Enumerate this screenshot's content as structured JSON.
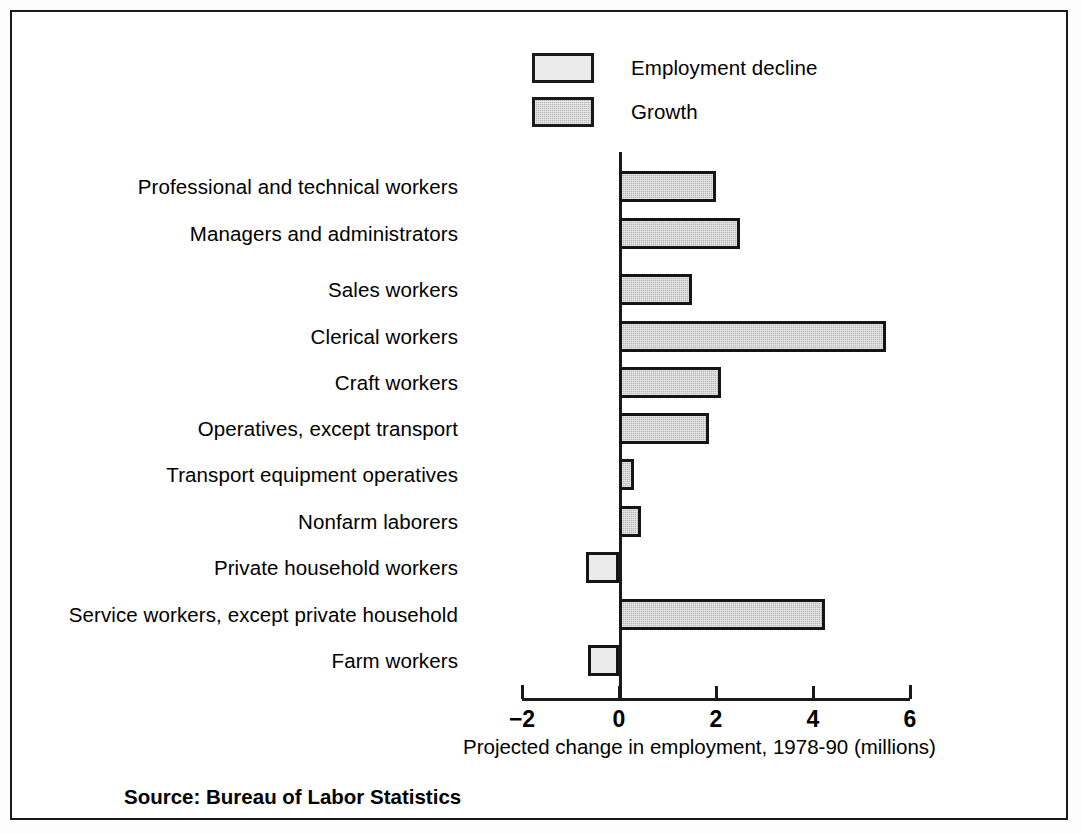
{
  "figure": {
    "background_color": "#ffffff",
    "frame_color": "#1a1a1a",
    "source_note": "Source: Bureau of Labor Statistics"
  },
  "legend": {
    "position": "top-center",
    "items": [
      {
        "label": "Employment decline",
        "swatch": "light-gray-square",
        "color": "#ebebeb"
      },
      {
        "label": "Growth",
        "swatch": "medium-gray-square",
        "color": "#b7b7b7"
      }
    ]
  },
  "chart_data": {
    "type": "bar",
    "orientation": "horizontal",
    "title": "",
    "subtitle": "",
    "xlabel": "Projected change in employment, 1978-90 (millions)",
    "ylabel": "",
    "xlim": [
      -2,
      6
    ],
    "xticks": [
      -2,
      0,
      2,
      4,
      6
    ],
    "xticklabels": [
      "−2",
      "0",
      "2",
      "4",
      "6"
    ],
    "grid": false,
    "legend_position": "top-center",
    "categories": [
      "Professional and technical workers",
      "Managers and administrators",
      "Sales workers",
      "Clerical workers",
      "Craft workers",
      "Operatives, except transport",
      "Transport equipment operatives",
      "Nonfarm laborers",
      "Private household workers",
      "Service workers, except private household",
      "Farm workers"
    ],
    "values": [
      2.0,
      2.5,
      1.5,
      5.5,
      2.1,
      1.85,
      0.3,
      0.45,
      -0.68,
      4.25,
      -0.64
    ],
    "series": [
      {
        "name": "Projected change in employment, 1978-90 (millions)",
        "values": [
          2.0,
          2.5,
          1.5,
          5.5,
          2.1,
          1.85,
          0.3,
          0.45,
          -0.68,
          4.25,
          -0.64
        ]
      }
    ],
    "bar_kinds": [
      "growth",
      "growth",
      "growth",
      "growth",
      "growth",
      "growth",
      "growth",
      "growth",
      "decline",
      "growth",
      "decline"
    ],
    "colors": {
      "growth": "#b7b7b7",
      "decline": "#ebebeb",
      "bar_edge": "#151515"
    }
  }
}
